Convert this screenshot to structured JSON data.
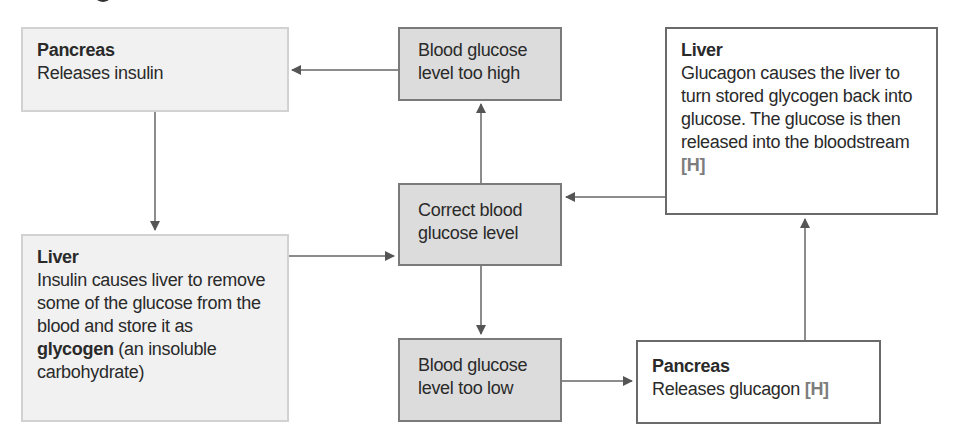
{
  "diagram": {
    "title_partial": "g",
    "boxes": {
      "pancreas_insulin": {
        "title": "Pancreas",
        "text": "Releases insulin"
      },
      "too_high": {
        "text": "Blood glucose level too high"
      },
      "liver_glucagon": {
        "title": "Liver",
        "text": "Glucagon causes the liver to turn stored glycogen back into glucose. The glucose is then released into the bloodstream",
        "tag": "[H]"
      },
      "liver_insulin": {
        "title": "Liver",
        "text_before": "Insulin causes liver to remove some of the glucose from the blood and store it as",
        "emphasis": "glycogen",
        "text_after": "(an insoluble carbohydrate)"
      },
      "correct": {
        "text": "Correct blood glucose level"
      },
      "too_low": {
        "text": "Blood glucose level too low"
      },
      "pancreas_glucagon": {
        "title": "Pancreas",
        "text": "Releases glucagon",
        "tag": "[H]"
      }
    },
    "arrows": [
      {
        "from": "too_high",
        "to": "pancreas_insulin"
      },
      {
        "from": "pancreas_insulin",
        "to": "liver_insulin"
      },
      {
        "from": "liver_insulin",
        "to": "correct"
      },
      {
        "from": "correct",
        "to": "too_high"
      },
      {
        "from": "correct",
        "to": "too_low"
      },
      {
        "from": "too_low",
        "to": "pancreas_glucagon"
      },
      {
        "from": "pancreas_glucagon",
        "to": "liver_glucagon"
      },
      {
        "from": "liver_glucagon",
        "to": "correct"
      }
    ],
    "colors": {
      "light_box": "#f1f1f1",
      "mid_box": "#dcdcdc",
      "white_box": "#ffffff",
      "arrow": "#555555",
      "tag": "#7d7d7d"
    }
  }
}
